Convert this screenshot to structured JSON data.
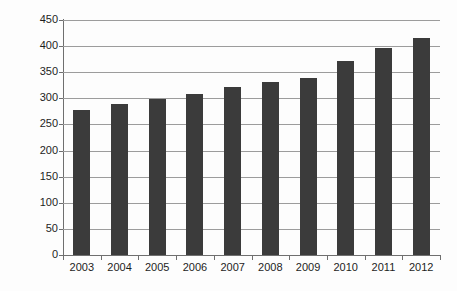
{
  "chart_data": {
    "type": "bar",
    "title": "",
    "subtitle": "",
    "xlabel": "",
    "ylabel": "Available seats (M)",
    "categories": [
      "2003",
      "2004",
      "2005",
      "2006",
      "2007",
      "2008",
      "2009",
      "2010",
      "2011",
      "2012"
    ],
    "values": [
      277,
      290,
      298,
      308,
      322,
      332,
      339,
      371,
      397,
      415
    ],
    "series": [
      {
        "name": "Available seats (M)",
        "values": [
          277,
          290,
          298,
          308,
          322,
          332,
          339,
          371,
          397,
          415
        ]
      }
    ],
    "ylim": [
      0,
      450
    ],
    "xlim": null,
    "y_ticks": [
      0,
      50,
      100,
      150,
      200,
      250,
      300,
      350,
      400,
      450
    ],
    "y_tick_labels": [
      "0",
      "50",
      "100",
      "150",
      "200",
      "250",
      "300",
      "350",
      "400",
      "450"
    ],
    "x_tick_labels": [
      "2003",
      "2004",
      "2005",
      "2006",
      "2007",
      "2008",
      "2009",
      "2010",
      "2011",
      "2012"
    ],
    "grid": "horizontal",
    "legend": "none",
    "annotations": [],
    "colors": {
      "bar": "#3b3b3b",
      "gridline": "#9c9c9c",
      "axis": "#6f6f6f",
      "background": "#fdfdfd",
      "text": "#1d1d1d"
    }
  }
}
